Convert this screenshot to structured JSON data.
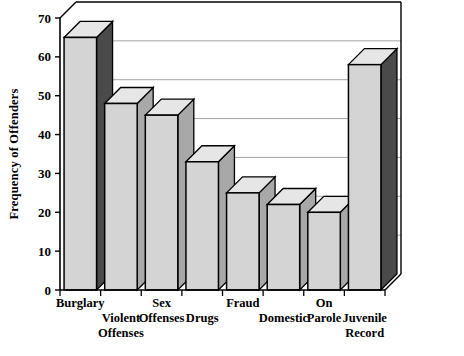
{
  "chart_data": {
    "type": "bar",
    "title": "",
    "subtitle": "",
    "xlabel": "",
    "ylabel": "Frequency of Offenders",
    "ylim": [
      0,
      70
    ],
    "ytick_values": [
      0,
      10,
      20,
      30,
      40,
      50,
      60,
      70
    ],
    "ytick_labels": [
      "0",
      "10",
      "20",
      "30",
      "40",
      "50",
      "60",
      "70"
    ],
    "grid": true,
    "grid_axis": "y",
    "legend": false,
    "style": "3d-bar",
    "categories": [
      "Burglary",
      "Violent Offenses",
      "Sex Offenses",
      "Drugs",
      "Fraud",
      "Domestic",
      "On Parole",
      "Juvenile Record"
    ],
    "category_label_lines": [
      [
        "Burglary"
      ],
      [
        "Violent",
        "Offenses"
      ],
      [
        "Sex",
        "Offenses"
      ],
      [
        "Drugs"
      ],
      [
        "Fraud"
      ],
      [
        "Domestic"
      ],
      [
        "On",
        "Parole"
      ],
      [
        "Juvenile",
        "Record"
      ]
    ],
    "values": [
      65,
      48,
      45,
      33,
      25,
      22,
      20,
      58
    ],
    "bar_face_color": "#d4d4d4",
    "bar_side_color": "#a8a8a8",
    "bar_side_color_dark": "#4a4a4a",
    "bar_outline_color": "#000000",
    "grid_color": "#9a9a9a",
    "axis_color": "#000000",
    "background_color": "#ffffff"
  }
}
